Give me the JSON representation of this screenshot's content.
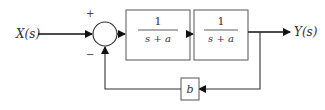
{
  "diagram": {
    "type": "block-diagram",
    "input_label": "X(s)",
    "output_label": "Y(s)",
    "summing_junction": {
      "plus_sign": "+",
      "minus_sign": "−"
    },
    "blocks": [
      {
        "id": "G1",
        "numerator": "1",
        "denominator": "s + a"
      },
      {
        "id": "G2",
        "numerator": "1",
        "denominator": "s + a"
      }
    ],
    "feedback_block": {
      "label": "b"
    },
    "colors": {
      "line": "#222222",
      "box": "#555555",
      "background": "#ffffff"
    }
  }
}
